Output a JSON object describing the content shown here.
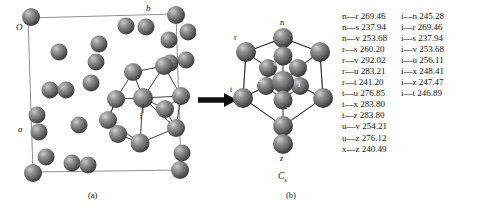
{
  "figure": {
    "panels": [
      {
        "id": "a",
        "caption": "(a)",
        "description": "crystal unit cell packing with highlighted cluster"
      },
      {
        "id": "b",
        "caption": "(b)",
        "description": "isolated coordination cluster"
      }
    ],
    "arrow": "right-arrow"
  },
  "panel_a": {
    "caption": "(a)",
    "axis_labels": {
      "origin": "O",
      "a": "a",
      "b": "b"
    },
    "highlight_atom_label": "i"
  },
  "panel_b": {
    "caption": "(b)",
    "point_group": "C",
    "point_group_sub": "s",
    "atom_labels": [
      "n",
      "r",
      "s",
      "v",
      "u",
      "i",
      "t",
      "x",
      "z"
    ]
  },
  "distances": {
    "unit": "pm",
    "left_column": [
      {
        "pair": "n—r",
        "value": "269.46"
      },
      {
        "pair": "n—s",
        "value": "237.94"
      },
      {
        "pair": "n—v",
        "value": "253.68"
      },
      {
        "pair": "r—s",
        "value": "260.20"
      },
      {
        "pair": "r—v",
        "value": "292.02"
      },
      {
        "pair": "r—u",
        "value": "283.21"
      },
      {
        "pair": "r—t",
        "value": "241.20"
      },
      {
        "pair": "t—u",
        "value": "276.85"
      },
      {
        "pair": "t—x",
        "value": "283.80"
      },
      {
        "pair": "t—z",
        "value": "283.80"
      },
      {
        "pair": "u—v",
        "value": "254.21"
      },
      {
        "pair": "u—z",
        "value": "276.12"
      },
      {
        "pair": "x—z",
        "value": "240.49"
      }
    ],
    "right_column": [
      {
        "pair": "i—n",
        "value": "245.28"
      },
      {
        "pair": "i—r",
        "value": "269.46"
      },
      {
        "pair": "i—s",
        "value": "237.94"
      },
      {
        "pair": "i—v",
        "value": "253.68"
      },
      {
        "pair": "i—u",
        "value": "256.11"
      },
      {
        "pair": "i—x",
        "value": "248.41"
      },
      {
        "pair": "i—z",
        "value": "247.47"
      },
      {
        "pair": "i—t",
        "value": "246.89"
      }
    ]
  },
  "colors": {
    "background": "#ffffff",
    "atom_base": "#6f6f6f",
    "atom_dark": "#3d3d3d",
    "atom_highlight": "#c8c8c8",
    "bond": "#2a2a2a",
    "cell_edge": "#8a8a8a",
    "text": "#111111"
  }
}
